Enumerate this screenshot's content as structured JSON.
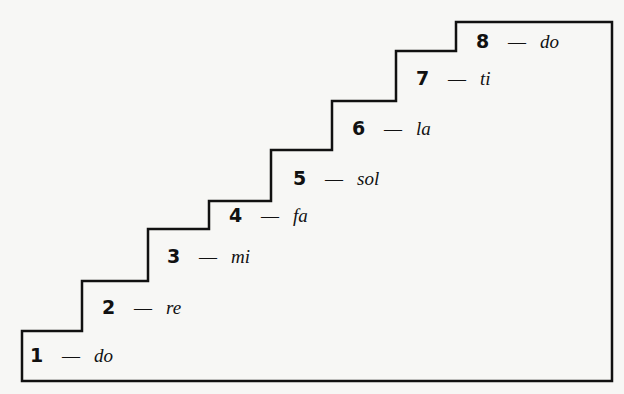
{
  "diagram": {
    "type": "staircase",
    "stroke_color": "#111111",
    "background_color": "#f7f7f5",
    "steps": [
      {
        "number": "1",
        "dash": "—",
        "syllable": "do",
        "x": 30,
        "y": 345
      },
      {
        "number": "2",
        "dash": "—",
        "syllable": "re",
        "x": 102,
        "y": 296
      },
      {
        "number": "3",
        "dash": "—",
        "syllable": "mi",
        "x": 167,
        "y": 245
      },
      {
        "number": "4",
        "dash": "—",
        "syllable": "fa",
        "x": 229,
        "y": 203
      },
      {
        "number": "5",
        "dash": "—",
        "syllable": "sol",
        "x": 293,
        "y": 166
      },
      {
        "number": "6",
        "dash": "—",
        "syllable": "la",
        "x": 352,
        "y": 117
      },
      {
        "number": "7",
        "dash": "—",
        "syllable": "ti",
        "x": 416,
        "y": 68
      },
      {
        "number": "8",
        "dash": "—",
        "syllable": "do",
        "x": 476,
        "y": 30
      }
    ]
  }
}
